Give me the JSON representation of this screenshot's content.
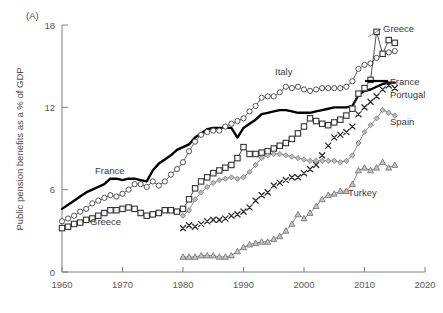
{
  "panel": {
    "label": "(A)"
  },
  "axes": {
    "ylabel": "Public pension benefits as a % of GDP",
    "xlabel": "",
    "yticks": [
      "0",
      "6",
      "12",
      "18"
    ],
    "xticks": [
      "1960",
      "1970",
      "1980",
      "1990",
      "2000",
      "2010",
      "2020"
    ]
  },
  "annotations": {
    "france_inline": "France",
    "greece_inline": "Greece",
    "italy_inline": "Italy",
    "turkey_inline": "Turkey",
    "greece_right": "Greece",
    "france_right": "France",
    "portugal_right": "Portugal",
    "spain_right": "Spain"
  },
  "colors": {
    "france": "#000000",
    "italy": "#444444",
    "greece": "#333333",
    "spain": "#777777",
    "portugal": "#2a2a2a",
    "turkey": "#6e6e6e",
    "axis": "#808080",
    "text": "#4d4d4d"
  },
  "chart_data": {
    "type": "line",
    "title": "",
    "xlabel": "",
    "ylabel": "Public pension benefits as a % of GDP",
    "xlim": [
      1960,
      2020
    ],
    "ylim": [
      0,
      18
    ],
    "xticks": [
      1960,
      1970,
      1980,
      1990,
      2000,
      2010,
      2020
    ],
    "yticks": [
      0,
      6,
      12,
      18
    ],
    "grid": false,
    "legend": "inline-labels",
    "series": [
      {
        "name": "France",
        "marker": "none",
        "line": "thick-solid",
        "color": "#000000",
        "x": [
          1960,
          1961,
          1962,
          1963,
          1964,
          1965,
          1966,
          1967,
          1968,
          1969,
          1970,
          1971,
          1972,
          1973,
          1974,
          1975,
          1976,
          1977,
          1978,
          1979,
          1980,
          1981,
          1982,
          1983,
          1984,
          1985,
          1986,
          1987,
          1988,
          1989,
          1990,
          1991,
          1992,
          1993,
          1994,
          1995,
          1996,
          1997,
          1998,
          1999,
          2000,
          2001,
          2002,
          2003,
          2004,
          2005,
          2006,
          2007,
          2008,
          2009,
          2010,
          2011,
          2012,
          2013,
          2014,
          2015
        ],
        "y": [
          4.6,
          4.9,
          5.2,
          5.5,
          5.8,
          6.0,
          6.2,
          6.4,
          6.8,
          6.8,
          6.7,
          6.8,
          6.8,
          6.7,
          6.6,
          7.4,
          7.9,
          8.2,
          8.5,
          8.9,
          9.1,
          9.3,
          9.8,
          10.1,
          10.4,
          10.5,
          10.5,
          10.5,
          10.5,
          9.8,
          10.5,
          10.8,
          11.1,
          11.5,
          11.6,
          11.7,
          11.8,
          11.8,
          11.7,
          11.6,
          11.6,
          11.6,
          11.7,
          11.8,
          11.9,
          12.0,
          12.0,
          12.0,
          12.1,
          12.9,
          13.2,
          13.3,
          13.5,
          13.7,
          13.8,
          13.8
        ]
      },
      {
        "name": "Italy",
        "marker": "circle-open",
        "line": "thin-solid",
        "color": "#444444",
        "x": [
          1960,
          1961,
          1962,
          1963,
          1964,
          1965,
          1966,
          1967,
          1968,
          1969,
          1970,
          1971,
          1972,
          1973,
          1974,
          1975,
          1976,
          1977,
          1978,
          1979,
          1980,
          1981,
          1982,
          1983,
          1984,
          1985,
          1986,
          1987,
          1988,
          1989,
          1990,
          1991,
          1992,
          1993,
          1994,
          1995,
          1996,
          1997,
          1998,
          1999,
          2000,
          2001,
          2002,
          2003,
          2004,
          2005,
          2006,
          2007,
          2008,
          2009,
          2010,
          2011,
          2012,
          2013,
          2014,
          2015
        ],
        "y": [
          3.7,
          3.9,
          4.1,
          4.4,
          4.6,
          5.0,
          5.2,
          5.4,
          5.6,
          5.5,
          5.7,
          6.0,
          6.4,
          6.4,
          6.2,
          6.6,
          6.3,
          6.6,
          7.1,
          7.5,
          8.0,
          8.8,
          9.5,
          10.0,
          10.2,
          10.3,
          10.3,
          10.6,
          10.8,
          11.0,
          11.2,
          11.7,
          12.1,
          12.7,
          12.8,
          12.8,
          13.1,
          13.5,
          13.4,
          13.5,
          13.3,
          13.2,
          13.3,
          13.4,
          13.4,
          13.4,
          13.4,
          13.5,
          13.9,
          14.8,
          15.1,
          15.2,
          15.6,
          15.9,
          16.0,
          16.1
        ]
      },
      {
        "name": "Greece",
        "marker": "square-open",
        "line": "thin-solid",
        "color": "#333333",
        "x": [
          1960,
          1961,
          1962,
          1963,
          1964,
          1965,
          1966,
          1967,
          1968,
          1969,
          1970,
          1971,
          1972,
          1973,
          1974,
          1975,
          1976,
          1977,
          1978,
          1979,
          1980,
          1981,
          1982,
          1983,
          1984,
          1985,
          1986,
          1987,
          1988,
          1989,
          1990,
          1991,
          1992,
          1993,
          1994,
          1995,
          1996,
          1997,
          1998,
          1999,
          2000,
          2001,
          2002,
          2003,
          2004,
          2005,
          2006,
          2007,
          2008,
          2009,
          2010,
          2011,
          2012,
          2013,
          2014,
          2015
        ],
        "y": [
          3.2,
          3.3,
          3.5,
          3.6,
          3.8,
          3.9,
          4.1,
          4.3,
          4.5,
          4.5,
          4.6,
          4.7,
          4.6,
          4.3,
          4.1,
          4.2,
          4.3,
          4.5,
          4.5,
          4.4,
          4.6,
          5.3,
          6.1,
          6.6,
          6.9,
          7.2,
          7.4,
          7.6,
          7.8,
          8.3,
          9.1,
          8.6,
          8.6,
          8.7,
          8.8,
          9.0,
          9.2,
          9.4,
          9.7,
          10.1,
          10.6,
          11.2,
          11.0,
          10.8,
          10.7,
          10.9,
          11.1,
          11.4,
          11.9,
          13.0,
          13.4,
          14.0,
          17.5,
          15.9,
          16.9,
          16.7
        ]
      },
      {
        "name": "Spain",
        "marker": "diamond-gray",
        "line": "thin-solid",
        "color": "#777777",
        "x": [
          1980,
          1981,
          1982,
          1983,
          1984,
          1985,
          1986,
          1987,
          1988,
          1989,
          1990,
          1991,
          1992,
          1993,
          1994,
          1995,
          1996,
          1997,
          1998,
          1999,
          2000,
          2001,
          2002,
          2003,
          2004,
          2005,
          2006,
          2007,
          2008,
          2009,
          2010,
          2011,
          2012,
          2013,
          2014,
          2015
        ],
        "y": [
          4.1,
          4.5,
          5.3,
          5.8,
          6.2,
          6.5,
          6.7,
          6.8,
          6.9,
          6.8,
          6.9,
          7.3,
          7.8,
          8.3,
          8.5,
          8.6,
          8.6,
          8.5,
          8.4,
          8.3,
          8.2,
          8.1,
          8.1,
          8.1,
          8.1,
          8.1,
          8.0,
          8.1,
          8.5,
          9.4,
          10.2,
          10.7,
          11.2,
          11.8,
          11.6,
          11.4
        ]
      },
      {
        "name": "Portugal",
        "marker": "cross-x",
        "line": "none",
        "color": "#2a2a2a",
        "x": [
          1980,
          1981,
          1982,
          1983,
          1984,
          1985,
          1986,
          1987,
          1988,
          1989,
          1990,
          1991,
          1992,
          1993,
          1994,
          1995,
          1996,
          1997,
          1998,
          1999,
          2000,
          2001,
          2002,
          2003,
          2004,
          2005,
          2006,
          2007,
          2008,
          2009,
          2010,
          2011,
          2012,
          2013,
          2014,
          2015
        ],
        "y": [
          3.2,
          3.4,
          3.3,
          3.5,
          3.7,
          3.8,
          3.8,
          3.9,
          4.1,
          4.2,
          4.4,
          4.7,
          5.2,
          5.6,
          5.8,
          6.3,
          6.5,
          6.7,
          6.9,
          6.9,
          7.2,
          7.5,
          7.8,
          8.5,
          9.2,
          9.8,
          10.0,
          10.2,
          10.6,
          11.5,
          12.0,
          12.4,
          12.8,
          13.3,
          13.6,
          13.4
        ]
      },
      {
        "name": "Turkey",
        "marker": "triangle-gray",
        "line": "thin-solid",
        "color": "#6e6e6e",
        "x": [
          1980,
          1981,
          1982,
          1983,
          1984,
          1985,
          1986,
          1987,
          1988,
          1989,
          1990,
          1991,
          1992,
          1993,
          1994,
          1995,
          1996,
          1997,
          1998,
          1999,
          2000,
          2001,
          2002,
          2003,
          2004,
          2005,
          2006,
          2007,
          2008,
          2009,
          2010,
          2011,
          2012,
          2013,
          2014,
          2015
        ],
        "y": [
          1.1,
          1.1,
          1.1,
          1.2,
          1.2,
          1.2,
          1.1,
          1.1,
          1.2,
          1.5,
          1.8,
          2.0,
          2.1,
          2.2,
          2.2,
          2.4,
          2.6,
          3.0,
          3.5,
          4.2,
          3.9,
          4.3,
          4.8,
          5.3,
          5.6,
          5.7,
          5.9,
          5.9,
          6.4,
          7.4,
          7.6,
          7.4,
          7.6,
          8.0,
          7.6,
          7.8
        ]
      }
    ]
  }
}
